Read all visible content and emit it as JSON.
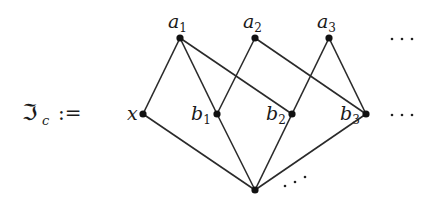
{
  "definition": {
    "symbol": "ℑ",
    "subscript": "c",
    "operator": ":="
  },
  "nodes": [
    {
      "id": "a1",
      "base": "a",
      "sub": "1",
      "x": 180,
      "y": 38,
      "label_pos": "above"
    },
    {
      "id": "a2",
      "base": "a",
      "sub": "2",
      "x": 255,
      "y": 38,
      "label_pos": "above"
    },
    {
      "id": "a3",
      "base": "a",
      "sub": "3",
      "x": 329,
      "y": 38,
      "label_pos": "above"
    },
    {
      "id": "x",
      "base": "x",
      "sub": "",
      "x": 143,
      "y": 114,
      "label_pos": "left"
    },
    {
      "id": "b1",
      "base": "b",
      "sub": "1",
      "x": 217,
      "y": 114,
      "label_pos": "left"
    },
    {
      "id": "b2",
      "base": "b",
      "sub": "2",
      "x": 292,
      "y": 114,
      "label_pos": "left"
    },
    {
      "id": "b3",
      "base": "b",
      "sub": "3",
      "x": 366,
      "y": 114,
      "label_pos": "left"
    },
    {
      "id": "bottom",
      "base": "",
      "sub": "",
      "x": 255,
      "y": 190,
      "label_pos": "none"
    }
  ],
  "edges": [
    [
      "a1",
      "x"
    ],
    [
      "a1",
      "b1"
    ],
    [
      "a1",
      "b2"
    ],
    [
      "a2",
      "b1"
    ],
    [
      "a2",
      "b3"
    ],
    [
      "a3",
      "b2"
    ],
    [
      "a3",
      "b3"
    ],
    [
      "x",
      "bottom"
    ],
    [
      "b1",
      "bottom"
    ],
    [
      "b2",
      "bottom"
    ],
    [
      "b3",
      "bottom"
    ]
  ],
  "ellipses": {
    "top_row": "⋯",
    "middle_row": "⋯",
    "bottom": "⋰"
  }
}
